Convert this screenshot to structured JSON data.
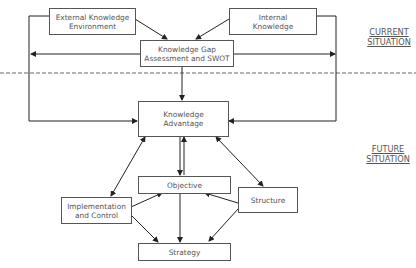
{
  "nodes": {
    "external": "External Knowledge\nEnvironment",
    "internal": "Internal\nKnowledge",
    "gap": "Knowledge Gap\nAssessment and SWOT",
    "advantage": "Knowledge\nAdvantage",
    "objective": "Objective",
    "implementation": "Implementation\nand Control",
    "structure": "Structure",
    "strategy": "Strategy"
  },
  "section_labels": {
    "current": "CURRENT\nSITUATION",
    "future": "FUTURE\nSITUATION"
  },
  "colors": {
    "line": "#222222",
    "box_border": "#555555",
    "text": "#555555",
    "divider": "#666666"
  }
}
